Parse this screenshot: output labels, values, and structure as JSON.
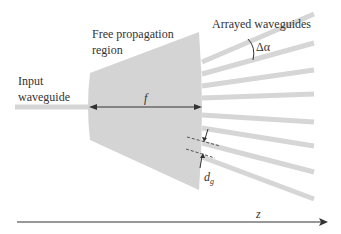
{
  "labels": {
    "input_line1": "Input",
    "input_line2": "waveguide",
    "fpr_line1": "Free propagation",
    "fpr_line2": "region",
    "arrayed": "Arrayed waveguides",
    "delta_alpha": "Δα",
    "focal": "f",
    "dg_main": "d",
    "dg_sub": "g",
    "z_axis": "z"
  },
  "colors": {
    "region_fill": "#d4d4d4",
    "waveguide": "#d6d6d6",
    "line": "#333333",
    "text": "#333333"
  },
  "waveguides": [
    {
      "x1": 202,
      "y1": 62,
      "x2": 314,
      "y2": 14
    },
    {
      "x1": 202,
      "y1": 74,
      "x2": 314,
      "y2": 43
    },
    {
      "x1": 202,
      "y1": 86,
      "x2": 314,
      "y2": 70
    },
    {
      "x1": 202,
      "y1": 98,
      "x2": 314,
      "y2": 94
    },
    {
      "x1": 202,
      "y1": 115,
      "x2": 314,
      "y2": 122
    },
    {
      "x1": 202,
      "y1": 128,
      "x2": 314,
      "y2": 146
    },
    {
      "x1": 202,
      "y1": 143,
      "x2": 314,
      "y2": 172
    },
    {
      "x1": 202,
      "y1": 157,
      "x2": 314,
      "y2": 199
    }
  ]
}
